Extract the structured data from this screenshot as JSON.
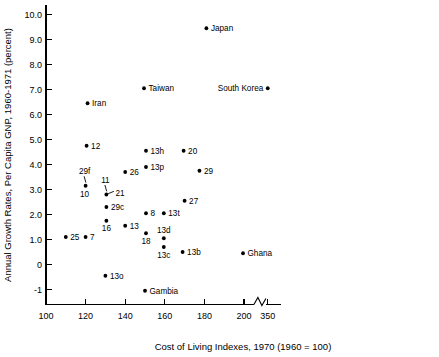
{
  "chart_data": {
    "type": "scatter",
    "title": "",
    "xlabel": "Cost of Living Indexes, 1970 (1960 = 100)",
    "ylabel": "Annual Growth Rates, Per Capita GNP, 1960-1971 (percent)",
    "xlim": [
      100,
      215
    ],
    "ylim": [
      -1.6,
      10.4
    ],
    "grid": false,
    "legend": "none",
    "axis_break": {
      "present": true,
      "after_value": 205,
      "resumes_label": "350"
    },
    "xticks": [
      {
        "value": 100,
        "label": "100"
      },
      {
        "value": 120,
        "label": "120"
      },
      {
        "value": 140,
        "label": "140"
      },
      {
        "value": 160,
        "label": "160"
      },
      {
        "value": 180,
        "label": "180"
      },
      {
        "value": 200,
        "label": "200"
      },
      {
        "value": 212,
        "label": "350"
      }
    ],
    "yticks": [
      {
        "value": 10.0,
        "label": "10.0"
      },
      {
        "value": 9.0,
        "label": "9.0"
      },
      {
        "value": 8.0,
        "label": "8.0"
      },
      {
        "value": 7.0,
        "label": "7.0"
      },
      {
        "value": 6.0,
        "label": "6.0"
      },
      {
        "value": 5.0,
        "label": "5.0"
      },
      {
        "value": 4.0,
        "label": "4.0"
      },
      {
        "value": 3.0,
        "label": "3.0"
      },
      {
        "value": 2.0,
        "label": "2.0"
      },
      {
        "value": 1.0,
        "label": "1.0"
      },
      {
        "value": 0.0,
        "label": "0"
      },
      {
        "value": -1.0,
        "label": "-1"
      }
    ],
    "points": [
      {
        "label": "Japan",
        "x": 181.0,
        "y": 9.45,
        "pos": "right"
      },
      {
        "label": "South Korea",
        "x": 212.0,
        "y": 7.05,
        "pos": "left"
      },
      {
        "label": "Taiwan",
        "x": 149.5,
        "y": 7.05,
        "pos": "right"
      },
      {
        "label": "Iran",
        "x": 121.0,
        "y": 6.45,
        "pos": "right"
      },
      {
        "label": "12",
        "x": 120.5,
        "y": 4.75,
        "pos": "right"
      },
      {
        "label": "13h",
        "x": 150.5,
        "y": 4.55,
        "pos": "right"
      },
      {
        "label": "20",
        "x": 169.5,
        "y": 4.55,
        "pos": "right"
      },
      {
        "label": "13p",
        "x": 150.5,
        "y": 3.9,
        "pos": "right"
      },
      {
        "label": "26",
        "x": 140.0,
        "y": 3.7,
        "pos": "right"
      },
      {
        "label": "29",
        "x": 177.5,
        "y": 3.75,
        "pos": "right"
      },
      {
        "label": "29f",
        "x": 120.0,
        "y": 3.15,
        "pos": "leader-up"
      },
      {
        "label": "10",
        "x": 120.0,
        "y": 3.15,
        "pos": "below"
      },
      {
        "label": "11",
        "x": 130.5,
        "y": 2.8,
        "pos": "leader-up"
      },
      {
        "label": "21",
        "x": 130.5,
        "y": 2.8,
        "pos": "right"
      },
      {
        "label": "27",
        "x": 170.0,
        "y": 2.55,
        "pos": "right"
      },
      {
        "label": "29c",
        "x": 130.5,
        "y": 2.3,
        "pos": "right"
      },
      {
        "label": "8",
        "x": 150.5,
        "y": 2.05,
        "pos": "right"
      },
      {
        "label": "13t",
        "x": 159.5,
        "y": 2.05,
        "pos": "right"
      },
      {
        "label": "16",
        "x": 130.5,
        "y": 1.75,
        "pos": "below"
      },
      {
        "label": "13",
        "x": 140.0,
        "y": 1.55,
        "pos": "right"
      },
      {
        "label": "18",
        "x": 150.5,
        "y": 1.25,
        "pos": "below"
      },
      {
        "label": "13d",
        "x": 159.5,
        "y": 1.05,
        "pos": "above"
      },
      {
        "label": "25",
        "x": 110.0,
        "y": 1.1,
        "pos": "right"
      },
      {
        "label": "7",
        "x": 120.0,
        "y": 1.1,
        "pos": "right"
      },
      {
        "label": "13c",
        "x": 159.5,
        "y": 0.7,
        "pos": "below"
      },
      {
        "label": "13b",
        "x": 169.0,
        "y": 0.5,
        "pos": "right"
      },
      {
        "label": "Ghana",
        "x": 199.5,
        "y": 0.45,
        "pos": "right"
      },
      {
        "label": "13o",
        "x": 130.0,
        "y": -0.45,
        "pos": "right"
      },
      {
        "label": "Gambia",
        "x": 150.0,
        "y": -1.05,
        "pos": "right"
      }
    ]
  },
  "colors": {
    "axis": "#000000",
    "point": "#000000",
    "background": "#ffffff"
  }
}
